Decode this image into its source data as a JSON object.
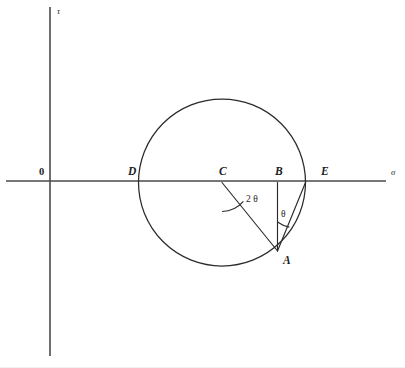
{
  "figure": {
    "background_color": "#ffffff",
    "line_color": "#2b2b2b",
    "axis_color": "#4a4a4a",
    "width": 405,
    "height": 368
  },
  "axes": {
    "horizontal": {
      "label": "σ",
      "label_x": 391,
      "label_y": 175,
      "x1": 6,
      "x2": 386,
      "y": 181
    },
    "vertical": {
      "label": "τ",
      "label_x": 57,
      "label_y": 14,
      "x": 50,
      "y1": 7,
      "y2": 356
    },
    "origin": {
      "label": "0",
      "x": 50,
      "y": 181,
      "label_x": 39,
      "label_y": 175
    }
  },
  "circle": {
    "center_x": 222,
    "center_y": 182.5,
    "radius": 83.5
  },
  "points": [
    {
      "id": "D",
      "label": "D",
      "x": 138.5,
      "y": 182.5,
      "label_x": 128,
      "label_y": 175
    },
    {
      "id": "C",
      "label": "C",
      "x": 222,
      "y": 182.5,
      "label_x": 219,
      "label_y": 175
    },
    {
      "id": "B",
      "label": "B",
      "x": 277.5,
      "y": 182.5,
      "label_x": 275,
      "label_y": 175
    },
    {
      "id": "E",
      "label": "E",
      "x": 305.5,
      "y": 182.5,
      "label_x": 321,
      "label_y": 175
    },
    {
      "id": "A",
      "label": "A",
      "x": 277.5,
      "y": 251,
      "label_x": 283,
      "label_y": 264
    }
  ],
  "segments": [
    {
      "id": "CA",
      "from": "C",
      "to": "A",
      "x1": 222,
      "y1": 182.5,
      "x2": 277.5,
      "y2": 251
    },
    {
      "id": "BA",
      "from": "B",
      "to": "A",
      "x1": 277.5,
      "y1": 182.5,
      "x2": 277.5,
      "y2": 251
    },
    {
      "id": "EA",
      "from": "E",
      "to": "A",
      "x1": 305.5,
      "y1": 182.5,
      "x2": 277.5,
      "y2": 251
    }
  ],
  "angles": [
    {
      "id": "two-theta",
      "label": "2 θ",
      "vertex": "C",
      "label_x": 246,
      "label_y": 202,
      "arc_path": "M 222 211.5 A 29 29 0 0 0 243.4 201.4"
    },
    {
      "id": "theta",
      "label": "θ",
      "vertex": "A",
      "label_x": 281,
      "label_y": 217,
      "arc_path": "M 277.5 222 A 29 29 0 0 0 289.4 227.1"
    }
  ]
}
